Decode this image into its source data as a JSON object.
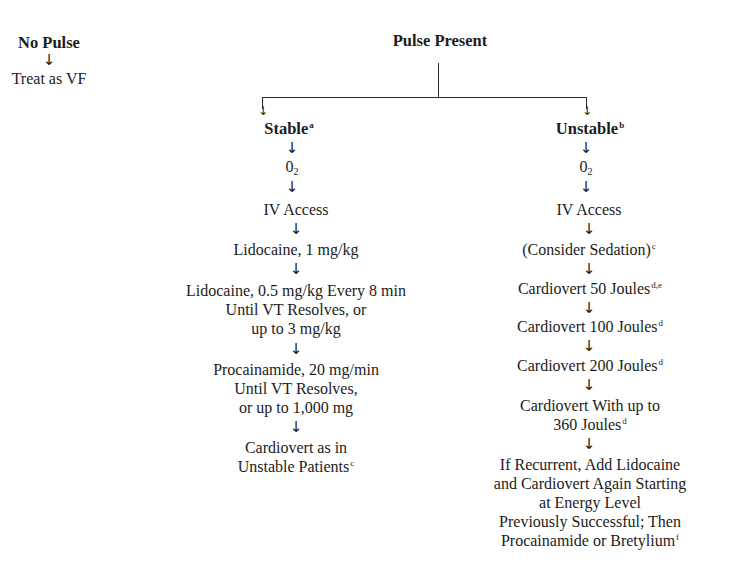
{
  "no_pulse": {
    "title": "No Pulse",
    "arrow": "↓",
    "action": "Treat as VF"
  },
  "pulse_present": {
    "title": "Pulse Present"
  },
  "stable": {
    "title": "Stable",
    "footnote": "a",
    "steps": [
      {
        "text": "0",
        "sub": "2"
      },
      {
        "text": "IV Access"
      },
      {
        "text": "Lidocaine, 1 mg/kg"
      },
      {
        "lines": [
          "Lidocaine, 0.5 mg/kg Every 8 min",
          "Until VT Resolves, or",
          "up to 3 mg/kg"
        ]
      },
      {
        "lines": [
          "Procainamide, 20 mg/min",
          "Until VT Resolves,",
          "or up to 1,000 mg"
        ]
      },
      {
        "lines": [
          "Cardiovert as in",
          "Unstable Patients"
        ],
        "footnote": "c"
      }
    ]
  },
  "unstable": {
    "title": "Unstable",
    "footnote": "b",
    "steps": [
      {
        "text": "0",
        "sub": "2"
      },
      {
        "text": "IV Access"
      },
      {
        "text": "(Consider Sedation)",
        "footnote": "c"
      },
      {
        "text": "Cardiovert 50 Joules",
        "footnote": "d,e"
      },
      {
        "text": "Cardiovert 100 Joules",
        "footnote": "d"
      },
      {
        "text": "Cardiovert 200 Joules",
        "footnote": "d"
      },
      {
        "lines": [
          "Cardiovert With up to",
          "360 Joules"
        ],
        "footnote": "d"
      },
      {
        "lines": [
          "If Recurrent, Add Lidocaine",
          "and Cardiovert Again Starting",
          "at Energy Level",
          "Previously Successful; Then",
          "Procainamide or Bretylium"
        ],
        "footnote": "f"
      }
    ]
  },
  "arrow_glyph": "↓"
}
